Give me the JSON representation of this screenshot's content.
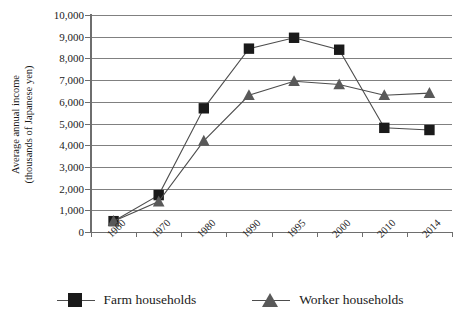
{
  "chart_data": {
    "type": "line",
    "title": "",
    "xlabel": "",
    "ylabel": "Average annual income\n(thousands of Japanese yen)",
    "categories": [
      "1960",
      "1970",
      "1980",
      "1990",
      "1995",
      "2000",
      "2010",
      "2014"
    ],
    "ylim": [
      0,
      10000
    ],
    "ytick_values": [
      0,
      1000,
      2000,
      3000,
      4000,
      5000,
      6000,
      7000,
      8000,
      9000,
      10000
    ],
    "ytick_labels": [
      "0",
      "1,000",
      "2,000",
      "3,000",
      "4,000",
      "5,000",
      "6,000",
      "7,000",
      "8,000",
      "9,000",
      "10,000"
    ],
    "grid": true,
    "legend_position": "bottom",
    "series": [
      {
        "name": "Farm households",
        "marker": "square",
        "color": "#1a1a1a",
        "values": [
          500,
          1700,
          5700,
          8450,
          8950,
          8400,
          4800,
          4700
        ]
      },
      {
        "name": "Worker households",
        "marker": "triangle",
        "color": "#595959",
        "values": [
          500,
          1400,
          4200,
          6300,
          6950,
          6800,
          6300,
          6400
        ]
      }
    ]
  },
  "axis": {
    "y_title_line1": "Average annual income",
    "y_title_line2": "(thousands of Japanese yen)"
  },
  "legend": {
    "items": [
      {
        "label": "Farm households",
        "marker": "square-marker",
        "color": "#1a1a1a"
      },
      {
        "label": "Worker households",
        "marker": "triangle-marker",
        "color": "#595959"
      }
    ]
  },
  "colors": {
    "grid": "#808080",
    "axis": "#6e6e6e",
    "farm": "#1a1a1a",
    "worker": "#595959",
    "background": "#ffffff"
  }
}
